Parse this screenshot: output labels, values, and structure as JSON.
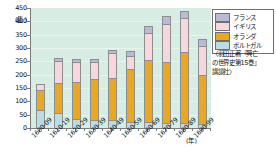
{
  "chart_data": {
    "type": "bar",
    "stacked": true,
    "title": "",
    "xlabel": "(年)",
    "ylabel": "(隻)",
    "ylim": [
      0,
      450
    ],
    "ytick_step": 50,
    "yticks": [
      0,
      50,
      100,
      150,
      200,
      250,
      300,
      350,
      400,
      450
    ],
    "grid": true,
    "legend_position": "right",
    "categories": [
      "1600-09",
      "1610-19",
      "1620-29",
      "1630-39",
      "1640-49",
      "1650-59",
      "1660-69",
      "1670-79",
      "1680-89",
      "1690-99"
    ],
    "series": [
      {
        "name": "ポルトガル",
        "color": "#b9dce6",
        "values": [
          68,
          55,
          33,
          29,
          29,
          21,
          18,
          15,
          14,
          12
        ]
      },
      {
        "name": "オランダ",
        "color": "#e8a823",
        "values": [
          76,
          117,
          141,
          157,
          162,
          205,
          238,
          232,
          275,
          188
        ]
      },
      {
        "name": "イギリス",
        "color": "#f6d7dd",
        "values": [
          22,
          82,
          78,
          63,
          92,
          48,
          105,
          145,
          125,
          110
        ]
      },
      {
        "name": "フランス",
        "color": "#b9bad8",
        "values": [
          0,
          10,
          8,
          8,
          8,
          14,
          20,
          28,
          24,
          22
        ]
      }
    ]
  },
  "yaxis": {
    "unit": "(隻)",
    "labels": [
      "450",
      "400",
      "350",
      "300",
      "250",
      "200",
      "150",
      "100",
      "50",
      "0"
    ]
  },
  "xaxis": {
    "unit": "(年)",
    "labels": [
      "1600-09",
      "1610-19",
      "1620-29",
      "1630-39",
      "1640-49",
      "1650-59",
      "1660-69",
      "1670-79",
      "1680-89",
      "1690-99"
    ]
  },
  "legend": {
    "items": [
      {
        "label": "フランス",
        "color": "#b9bad8"
      },
      {
        "label": "イギリス",
        "color": "#f6d7dd"
      },
      {
        "label": "オランダ",
        "color": "#e8a823"
      },
      {
        "label": "ポルトガル",
        "color": "#b9dce6"
      }
    ]
  },
  "source": {
    "lines": [
      "〈羽田正著『興亡",
      "の世界史第15巻』",
      "講談社〉"
    ]
  },
  "colors": {
    "plot_background": "#d7ece3",
    "axis": "#7a7a7a",
    "bar_outline": "#8e8e8e",
    "page_background": "#ffffff"
  }
}
